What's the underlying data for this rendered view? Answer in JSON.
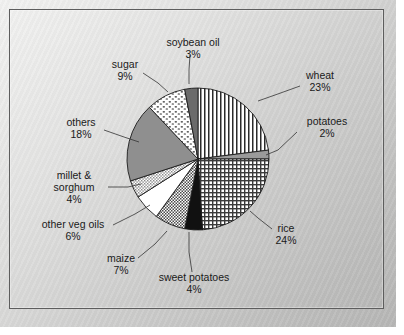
{
  "figure": {
    "background_color": "#d8d8d7",
    "frame_color": "#5d5d5d",
    "label_color": "#1a1a1a"
  },
  "chart_data": {
    "type": "pie",
    "title": "",
    "subtitle": "",
    "xlabel": "",
    "ylabel": "",
    "legend_position": "none-labels-with-leader-lines",
    "grid": false,
    "start_angle_deg": 0,
    "direction": "clockwise",
    "units": "percent",
    "total": 100,
    "categories": [
      "wheat",
      "potatoes",
      "rice",
      "sweet potatoes",
      "maize",
      "other veg oils",
      "millet & sorghum",
      "others",
      "sugar",
      "soybean oil"
    ],
    "values": [
      23,
      2,
      24,
      4,
      7,
      6,
      4,
      18,
      9,
      3
    ],
    "slices": [
      {
        "label": "wheat",
        "value": 23,
        "value_text": "23%",
        "fill_style": "vertical-lines",
        "fill_color": "#ffffff",
        "pattern_color": "#2a2a2a",
        "label_x": 320,
        "label_y": 79,
        "label_anchor": "middle",
        "leader": [
          [
            300,
            86
          ],
          [
            275,
            95
          ],
          [
            258,
            101
          ]
        ]
      },
      {
        "label": "potatoes",
        "value": 2,
        "value_text": "2%",
        "fill_style": "solid",
        "fill_color": "#9a9a9a",
        "pattern_color": "#9a9a9a",
        "label_x": 327,
        "label_y": 125,
        "label_anchor": "middle",
        "leader": [
          [
            297,
            132
          ],
          [
            278,
            150
          ],
          [
            266,
            155
          ]
        ]
      },
      {
        "label": "rice",
        "value": 24,
        "value_text": "24%",
        "fill_style": "fine-grid",
        "fill_color": "#ffffff",
        "pattern_color": "#3a3a3a",
        "label_x": 286,
        "label_y": 232,
        "label_anchor": "middle",
        "leader": [
          [
            272,
            229
          ],
          [
            258,
            218
          ],
          [
            250,
            211
          ]
        ]
      },
      {
        "label": "sweet potatoes",
        "value": 4,
        "value_text": "4%",
        "fill_style": "solid",
        "fill_color": "#111111",
        "pattern_color": "#111111",
        "label_x": 194,
        "label_y": 281,
        "label_anchor": "middle",
        "leader": [
          [
            192,
            272
          ],
          [
            189,
            252
          ],
          [
            189,
            232
          ]
        ]
      },
      {
        "label": "maize",
        "value": 7,
        "value_text": "7%",
        "fill_style": "checker",
        "fill_color": "#ffffff",
        "pattern_color": "#4a4a4a",
        "label_x": 121,
        "label_y": 262,
        "label_anchor": "middle",
        "leader": [
          [
            138,
            258
          ],
          [
            155,
            244
          ],
          [
            167,
            231
          ]
        ]
      },
      {
        "label": "other veg oils",
        "value": 6,
        "value_text": "6%",
        "fill_style": "solid",
        "fill_color": "#ffffff",
        "pattern_color": "#ffffff",
        "label_x": 73,
        "label_y": 228,
        "label_anchor": "middle",
        "leader": [
          [
            113,
            225
          ],
          [
            135,
            214
          ],
          [
            150,
            205
          ]
        ]
      },
      {
        "label": "millet & sorghum",
        "value": 4,
        "value_text": "4%",
        "fill_style": "light-checker",
        "fill_color": "#ffffff",
        "pattern_color": "#666666",
        "label_x": 74,
        "label_y": 179,
        "label_anchor": "middle",
        "leader": [
          [
            108,
            187
          ],
          [
            128,
            187
          ],
          [
            141,
            184
          ]
        ]
      },
      {
        "label": "others",
        "value": 18,
        "value_text": "18%",
        "fill_style": "solid",
        "fill_color": "#8f8f8f",
        "pattern_color": "#8f8f8f",
        "label_x": 81,
        "label_y": 126,
        "label_anchor": "middle",
        "leader": [
          [
            104,
            130
          ],
          [
            124,
            137
          ],
          [
            139,
            142
          ]
        ]
      },
      {
        "label": "sugar",
        "value": 9,
        "value_text": "9%",
        "fill_style": "dots",
        "fill_color": "#ffffff",
        "pattern_color": "#2e2e2e",
        "label_x": 125,
        "label_y": 68,
        "label_anchor": "middle",
        "leader": [
          [
            143,
            73
          ],
          [
            158,
            83
          ],
          [
            168,
            92
          ]
        ]
      },
      {
        "label": "soybean oil",
        "value": 3,
        "value_text": "3%",
        "fill_style": "solid",
        "fill_color": "#6b6b6b",
        "pattern_color": "#6b6b6b",
        "label_x": 193,
        "label_y": 46,
        "label_anchor": "middle",
        "leader": [
          [
            190,
            55
          ],
          [
            189,
            70
          ],
          [
            189,
            84
          ]
        ]
      }
    ],
    "geometry": {
      "center_x": 198,
      "center_y": 159,
      "radius": 71
    }
  },
  "labels": {
    "wheat_name": "wheat",
    "wheat_pct": "23%",
    "potatoes_name": "potatoes",
    "potatoes_pct": "2%",
    "rice_name": "rice",
    "rice_pct": "24%",
    "sweet_potatoes_name": "sweet potatoes",
    "sweet_potatoes_pct": "4%",
    "maize_name": "maize",
    "maize_pct": "7%",
    "other_veg_oils_name": "other veg oils",
    "other_veg_oils_pct": "6%",
    "millet_name_line1": "millet &",
    "millet_name_line2": "sorghum",
    "millet_pct": "4%",
    "others_name": "others",
    "others_pct": "18%",
    "sugar_name": "sugar",
    "sugar_pct": "9%",
    "soybean_oil_name": "soybean oil",
    "soybean_oil_pct": "3%"
  }
}
